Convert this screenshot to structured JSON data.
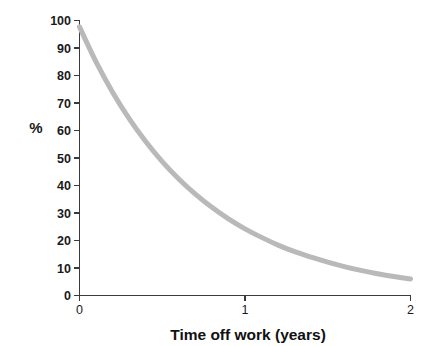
{
  "chart_data": {
    "type": "line",
    "title": "",
    "subtitle": "",
    "xlabel": "Time off work (years)",
    "ylabel": "%",
    "xlim": [
      0,
      2
    ],
    "ylim": [
      0,
      100
    ],
    "grid": false,
    "legend": false,
    "legend_position": "none",
    "x_ticks": [
      0,
      1,
      2
    ],
    "x_tick_labels": [
      "0",
      "1",
      "2"
    ],
    "y_ticks": [
      0,
      10,
      20,
      30,
      40,
      50,
      60,
      70,
      80,
      90,
      100
    ],
    "y_tick_labels": [
      "0",
      "10",
      "20",
      "30",
      "40",
      "50",
      "60",
      "70",
      "80",
      "90",
      "100"
    ],
    "series": [
      {
        "name": "Probability of return to work",
        "color": "#b9b9b9",
        "line_width": 5,
        "x": [
          0,
          0.1,
          0.2,
          0.3,
          0.4,
          0.5,
          0.6,
          0.7,
          0.8,
          0.9,
          1.0,
          1.1,
          1.2,
          1.3,
          1.4,
          1.5,
          1.6,
          1.7,
          1.8,
          1.9,
          2.0
        ],
        "values": [
          97.5,
          84.8,
          73.8,
          64.2,
          55.9,
          48.6,
          42.3,
          36.8,
          32.0,
          27.8,
          24.2,
          21.1,
          18.3,
          15.9,
          13.9,
          12.1,
          10.5,
          9.1,
          7.9,
          6.9,
          6.0
        ]
      }
    ],
    "annotations": []
  },
  "axes": {
    "y_axis_label": "%",
    "x_axis_label": "Time off work (years)"
  },
  "colors": {
    "curve": "#b9b9b9",
    "axis": "#3a3a3a",
    "text": "#1a1a1a",
    "background": "#ffffff"
  }
}
